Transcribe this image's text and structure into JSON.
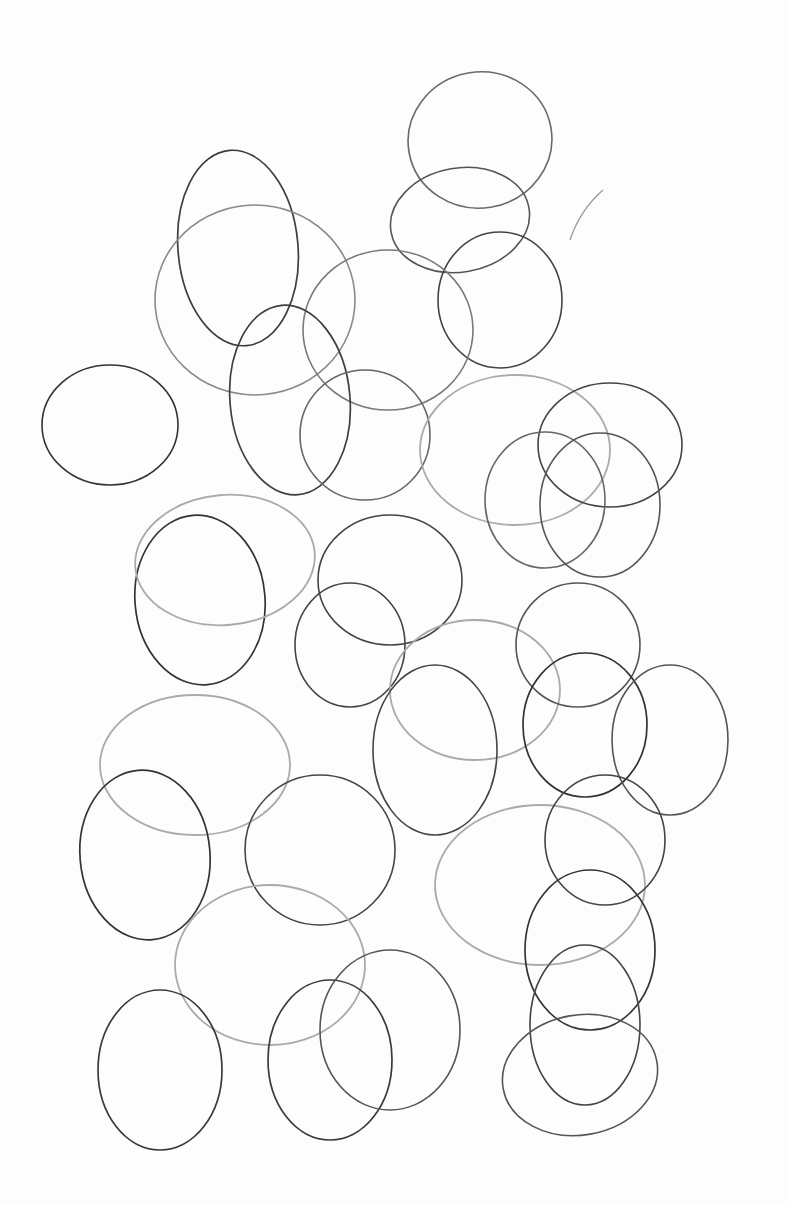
{
  "canvas": {
    "width": 787,
    "height": 1205,
    "paper_color": "#fdfdfd"
  },
  "ellipses": [
    {
      "cx": 480,
      "cy": 140,
      "rx": 72,
      "ry": 68,
      "rot": -10,
      "stroke": "#6a6a6a",
      "w": 1.6
    },
    {
      "cx": 460,
      "cy": 220,
      "rx": 70,
      "ry": 52,
      "rot": -10,
      "stroke": "#555",
      "w": 1.6
    },
    {
      "cx": 500,
      "cy": 300,
      "rx": 62,
      "ry": 68,
      "rot": 0,
      "stroke": "#444",
      "w": 1.6
    },
    {
      "cx": 238,
      "cy": 248,
      "rx": 60,
      "ry": 98,
      "rot": -5,
      "stroke": "#3d3d3d",
      "w": 1.7
    },
    {
      "cx": 255,
      "cy": 300,
      "rx": 100,
      "ry": 95,
      "rot": 0,
      "stroke": "#8a8a8a",
      "w": 1.6
    },
    {
      "cx": 388,
      "cy": 330,
      "rx": 85,
      "ry": 80,
      "rot": 0,
      "stroke": "#7a7a7a",
      "w": 1.6
    },
    {
      "cx": 290,
      "cy": 400,
      "rx": 60,
      "ry": 95,
      "rot": -5,
      "stroke": "#3f3f3f",
      "w": 1.7
    },
    {
      "cx": 365,
      "cy": 435,
      "rx": 65,
      "ry": 65,
      "rot": 0,
      "stroke": "#666",
      "w": 1.6
    },
    {
      "cx": 110,
      "cy": 425,
      "rx": 68,
      "ry": 60,
      "rot": 0,
      "stroke": "#333",
      "w": 1.6
    },
    {
      "cx": 515,
      "cy": 450,
      "rx": 95,
      "ry": 75,
      "rot": 0,
      "stroke": "#aaa",
      "w": 1.8
    },
    {
      "cx": 610,
      "cy": 445,
      "rx": 72,
      "ry": 62,
      "rot": 0,
      "stroke": "#444",
      "w": 1.6
    },
    {
      "cx": 545,
      "cy": 500,
      "rx": 60,
      "ry": 68,
      "rot": 0,
      "stroke": "#666",
      "w": 1.6
    },
    {
      "cx": 600,
      "cy": 505,
      "rx": 60,
      "ry": 72,
      "rot": 0,
      "stroke": "#555",
      "w": 1.6
    },
    {
      "cx": 200,
      "cy": 600,
      "rx": 65,
      "ry": 85,
      "rot": -5,
      "stroke": "#333",
      "w": 1.7
    },
    {
      "cx": 225,
      "cy": 560,
      "rx": 90,
      "ry": 65,
      "rot": -5,
      "stroke": "#aaa",
      "w": 1.8
    },
    {
      "cx": 390,
      "cy": 580,
      "rx": 72,
      "ry": 65,
      "rot": 0,
      "stroke": "#444",
      "w": 1.6
    },
    {
      "cx": 350,
      "cy": 645,
      "rx": 55,
      "ry": 62,
      "rot": 0,
      "stroke": "#444",
      "w": 1.6
    },
    {
      "cx": 475,
      "cy": 690,
      "rx": 85,
      "ry": 70,
      "rot": 0,
      "stroke": "#aaa",
      "w": 1.8
    },
    {
      "cx": 435,
      "cy": 750,
      "rx": 62,
      "ry": 85,
      "rot": 0,
      "stroke": "#444",
      "w": 1.6
    },
    {
      "cx": 578,
      "cy": 645,
      "rx": 62,
      "ry": 62,
      "rot": 0,
      "stroke": "#555",
      "w": 1.6
    },
    {
      "cx": 585,
      "cy": 725,
      "rx": 62,
      "ry": 72,
      "rot": 0,
      "stroke": "#333",
      "w": 1.7
    },
    {
      "cx": 670,
      "cy": 740,
      "rx": 58,
      "ry": 75,
      "rot": 0,
      "stroke": "#555",
      "w": 1.6
    },
    {
      "cx": 195,
      "cy": 765,
      "rx": 95,
      "ry": 70,
      "rot": 0,
      "stroke": "#aaa",
      "w": 1.8
    },
    {
      "cx": 145,
      "cy": 855,
      "rx": 65,
      "ry": 85,
      "rot": -5,
      "stroke": "#333",
      "w": 1.7
    },
    {
      "cx": 320,
      "cy": 850,
      "rx": 75,
      "ry": 75,
      "rot": 0,
      "stroke": "#444",
      "w": 1.6
    },
    {
      "cx": 540,
      "cy": 885,
      "rx": 105,
      "ry": 80,
      "rot": 0,
      "stroke": "#aaa",
      "w": 1.8
    },
    {
      "cx": 605,
      "cy": 840,
      "rx": 60,
      "ry": 65,
      "rot": 0,
      "stroke": "#444",
      "w": 1.6
    },
    {
      "cx": 590,
      "cy": 950,
      "rx": 65,
      "ry": 80,
      "rot": 0,
      "stroke": "#333",
      "w": 1.7
    },
    {
      "cx": 270,
      "cy": 965,
      "rx": 95,
      "ry": 80,
      "rot": 0,
      "stroke": "#aaa",
      "w": 1.8
    },
    {
      "cx": 160,
      "cy": 1070,
      "rx": 62,
      "ry": 80,
      "rot": 0,
      "stroke": "#3a3a3a",
      "w": 1.7
    },
    {
      "cx": 330,
      "cy": 1060,
      "rx": 62,
      "ry": 80,
      "rot": 0,
      "stroke": "#3a3a3a",
      "w": 1.7
    },
    {
      "cx": 390,
      "cy": 1030,
      "rx": 70,
      "ry": 80,
      "rot": 0,
      "stroke": "#555",
      "w": 1.6
    },
    {
      "cx": 585,
      "cy": 1025,
      "rx": 55,
      "ry": 80,
      "rot": 0,
      "stroke": "#444",
      "w": 1.6
    },
    {
      "cx": 580,
      "cy": 1075,
      "rx": 78,
      "ry": 60,
      "rot": -10,
      "stroke": "#555",
      "w": 1.6
    }
  ],
  "arcs": [
    {
      "d": "M570,240 Q580,210 603,190",
      "stroke": "#999",
      "w": 1.3
    }
  ]
}
